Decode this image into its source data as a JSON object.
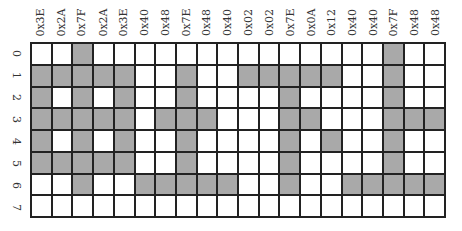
{
  "columns": [
    "0x3E",
    "0x2A",
    "0x7F",
    "0x2A",
    "0x3E",
    "0x40",
    "0x48",
    "0x7E",
    "0x48",
    "0x40",
    "0x02",
    "0x02",
    "0x7E",
    "0x0A",
    "0x12",
    "0x40",
    "0x40",
    "0x7F",
    "0x48",
    "0x48"
  ],
  "rows": [
    "0",
    "1",
    "2",
    "3",
    "4",
    "5",
    "6",
    "7"
  ],
  "bit_order": "row index = bit position (row 0 = LSB at top)",
  "colors": {
    "filled": "#a9a9a9",
    "empty": "#ffffff",
    "grid_line": "#222222"
  }
}
